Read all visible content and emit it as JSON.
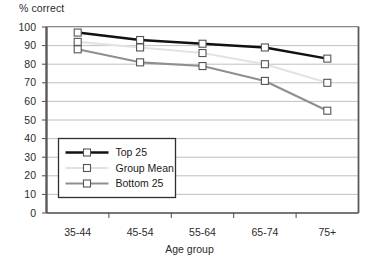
{
  "chart_data": {
    "type": "line",
    "title": "",
    "xlabel": "Age group",
    "ylabel": "% correct",
    "categories": [
      "35-44",
      "45-54",
      "55-64",
      "65-74",
      "75+"
    ],
    "ylim": [
      0,
      100
    ],
    "ytick_step": 10,
    "yticks": [
      "100",
      "90",
      "80",
      "70",
      "60",
      "50",
      "40",
      "30",
      "20",
      "10",
      "0"
    ],
    "grid": "horizontal",
    "legend_position": "inside-lower-left",
    "series": [
      {
        "name": "Top 25",
        "values": [
          97,
          93,
          91,
          89,
          83
        ],
        "color": "#111111",
        "marker": "square-open"
      },
      {
        "name": "Group Mean",
        "values": [
          92,
          89,
          86,
          80,
          70
        ],
        "color": "#e3e3e3",
        "marker": "square-open"
      },
      {
        "name": "Bottom 25",
        "values": [
          88,
          81,
          79,
          71,
          55
        ],
        "color": "#8f8f8f",
        "marker": "square-open"
      }
    ]
  },
  "axis": {
    "ylabel_text": "% correct",
    "xlabel_text": "Age group"
  },
  "legend": {
    "entries": [
      {
        "label": "Top 25"
      },
      {
        "label": "Group Mean"
      },
      {
        "label": "Bottom 25"
      }
    ]
  }
}
